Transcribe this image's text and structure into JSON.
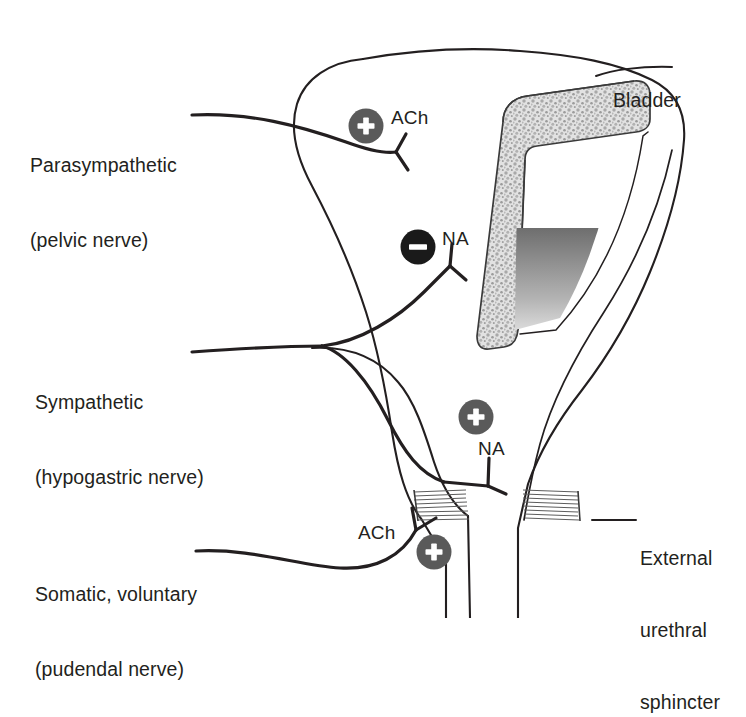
{
  "figure": {
    "background_color": "#ffffff",
    "stroke_color": "#231f20"
  },
  "labels": {
    "bladder": "Bladder",
    "parasympathetic": {
      "line1": "Parasympathetic",
      "line2": "(pelvic nerve)"
    },
    "sympathetic": {
      "line1": "Sympathetic",
      "line2": "(hypogastric nerve)"
    },
    "somatic": {
      "line1": "Somatic, voluntary",
      "line2": "(pudendal nerve)"
    },
    "sphincter": {
      "line1": "External",
      "line2": "urethral",
      "line3": "sphincter"
    }
  },
  "neurotransmitters": [
    {
      "id": "ach-top",
      "text": "ACh",
      "sign": "+",
      "sign_color": "#5a5a5a",
      "target": "detrusor-muscle"
    },
    {
      "id": "na-mid",
      "text": "NA",
      "sign": "−",
      "sign_color": "#1a1a1a",
      "target": "bladder-body"
    },
    {
      "id": "na-low",
      "text": "NA",
      "sign": "+",
      "sign_color": "#5a5a5a",
      "target": "internal-sphincter"
    },
    {
      "id": "ach-bottom",
      "text": "ACh",
      "sign": "+",
      "sign_color": "#5a5a5a",
      "target": "external-urethral-sphincter"
    }
  ],
  "signs": {
    "plus_symbol": "+",
    "minus_symbol": "−",
    "plus_fill": "#5a5a5a",
    "minus_fill": "#1a1a1a",
    "symbol_stroke": "#ffffff"
  },
  "anatomy": {
    "bladder_wall_fill": "#d8d8d8",
    "urine_gradient_top": "#6e6e6e",
    "urine_gradient_bottom": "#ffffff",
    "sphincter_striation_color": "#5d5d5d",
    "parts": [
      "bladder-body",
      "detrusor-muscle-wall-cutaway",
      "bladder-lumen",
      "urethra",
      "external-urethral-sphincter"
    ]
  },
  "nerves": [
    {
      "id": "pelvic-nerve",
      "label": "Parasympathetic (pelvic nerve)"
    },
    {
      "id": "hypogastric-nerve",
      "label": "Sympathetic (hypogastric nerve)"
    },
    {
      "id": "pudendal-nerve",
      "label": "Somatic, voluntary (pudendal nerve)"
    }
  ]
}
